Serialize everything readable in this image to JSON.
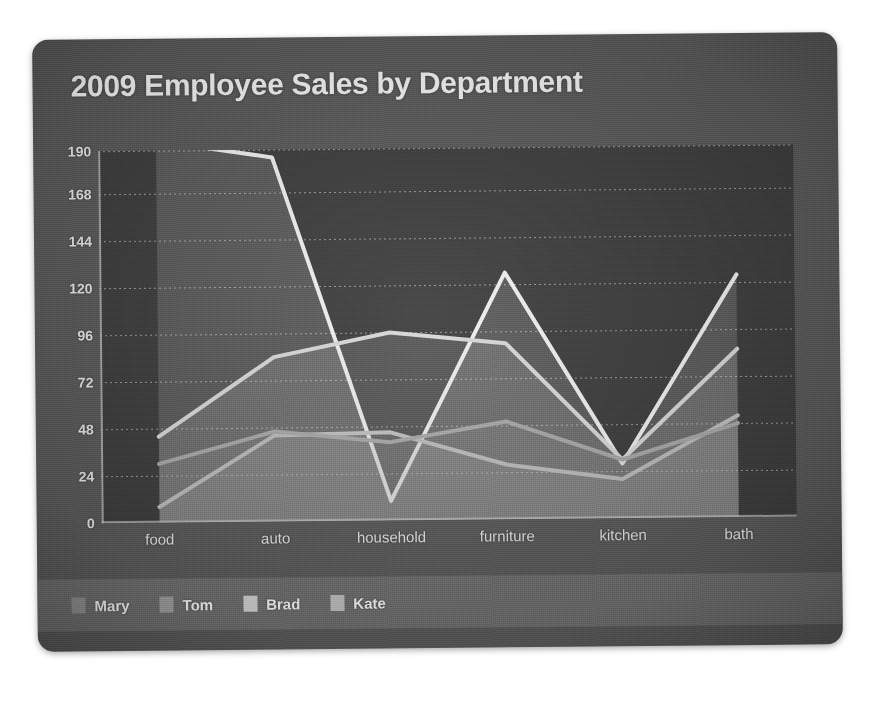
{
  "card": {
    "background_color": "#5a5a5a",
    "plot_background_color": "#3e3e3e",
    "legend_band_color": "#6e6e6e"
  },
  "chart_data": {
    "type": "line",
    "title": "2009 Employee Sales by Department",
    "xlabel": "",
    "ylabel": "",
    "categories": [
      "food",
      "auto",
      "household",
      "furniture",
      "kitchen",
      "bath"
    ],
    "yticks": [
      0,
      24,
      48,
      72,
      96,
      120,
      144,
      168,
      190
    ],
    "ylim": [
      0,
      190
    ],
    "grid": true,
    "legend_position": "bottom-left",
    "series": [
      {
        "name": "Mary",
        "color": "#f0f0f0",
        "values": [
          195,
          186,
          10,
          126,
          28,
          124
        ]
      },
      {
        "name": "Tom",
        "color": "#d8d8d8",
        "values": [
          44,
          84,
          96,
          90,
          30,
          86
        ]
      },
      {
        "name": "Brad",
        "color": "#c0c0c0",
        "values": [
          8,
          44,
          45,
          28,
          20,
          52
        ]
      },
      {
        "name": "Kate",
        "color": "#a8a8a8",
        "values": [
          30,
          46,
          40,
          50,
          30,
          48
        ]
      }
    ]
  },
  "legend": {
    "items": [
      {
        "label": "Mary",
        "color": "#8f8f8f"
      },
      {
        "label": "Tom",
        "color": "#9c9c9c"
      },
      {
        "label": "Brad",
        "color": "#cfcfcf"
      },
      {
        "label": "Kate",
        "color": "#bdbdbd"
      }
    ]
  }
}
